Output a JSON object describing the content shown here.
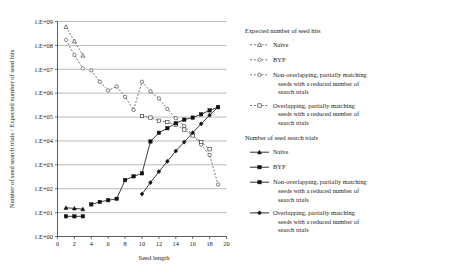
{
  "chart_data": {
    "type": "line",
    "title": "",
    "xlabel": "Seed length",
    "ylabel": "Number of seed search trials / Expected number of seed hits",
    "xlim": [
      0,
      20
    ],
    "ylim": [
      1,
      1000000000
    ],
    "yscale": "log",
    "grid": "horizontal",
    "legend_position": "right",
    "xticks": [
      "0",
      "2",
      "4",
      "6",
      "8",
      "10",
      "12",
      "14",
      "16",
      "18",
      "20"
    ],
    "yticks": [
      "1.E+00",
      "1.E+01",
      "1.E+02",
      "1.E+03",
      "1.E+04",
      "1.E+05",
      "1.E+06",
      "1.E+07",
      "1.E+08",
      "1.E+09"
    ],
    "legend_groups": [
      {
        "heading": "Expected number of seed hits",
        "entries": [
          {
            "label": "Naïve",
            "style": "dashed",
            "marker": "triangle-open"
          },
          {
            "label": "BYP",
            "style": "dashed",
            "marker": "diamond-open"
          },
          {
            "label": "Non-overlapping, partially matching seeds with a reduced number of search trials",
            "style": "dashed",
            "marker": "circle-open"
          },
          {
            "label": "Overlapping, partially matching seeds with a reduced number of search trials",
            "style": "dashed",
            "marker": "square-open"
          }
        ]
      },
      {
        "heading": "Number of seed search trials",
        "entries": [
          {
            "label": "Naïve",
            "style": "solid",
            "marker": "triangle-filled"
          },
          {
            "label": "BYP",
            "style": "solid",
            "marker": "square-filled"
          },
          {
            "label": "Non-overlapping, partially matching seeds with a reduced number of search trials",
            "style": "solid",
            "marker": "square-filled"
          },
          {
            "label": "Overlapping, partially matching seeds with a reduced number of search trials",
            "style": "solid",
            "marker": "diamond-filled"
          }
        ]
      }
    ],
    "series": [
      {
        "name": "Expected number of seed hits — Naïve",
        "group": "Expected number of seed hits",
        "style": "dashed",
        "marker": "triangle-open",
        "x": [
          1,
          2,
          3
        ],
        "values": [
          600000000,
          150000000,
          38000000
        ]
      },
      {
        "name": "Expected number of seed hits — BYP",
        "group": "Expected number of seed hits",
        "style": "dashed",
        "marker": "diamond-open",
        "x": [
          1,
          2,
          3
        ],
        "values": [
          170000000,
          40000000,
          11000000
        ]
      },
      {
        "name": "Expected number of seed hits — Non-overlapping, partially matching seeds with a reduced number of search trials",
        "group": "Expected number of seed hits",
        "style": "dashed",
        "marker": "circle-open",
        "x": [
          4,
          5,
          6,
          7,
          8,
          9,
          10,
          11,
          12,
          13,
          14,
          15,
          16,
          17,
          18,
          19
        ],
        "values": [
          9000000,
          3000000,
          1300000,
          1900000,
          700000,
          200000,
          3000000,
          1200000,
          600000,
          220000,
          90000,
          42000,
          18000,
          7000,
          2600,
          150
        ]
      },
      {
        "name": "Expected number of seed hits — Overlapping, partially matching seeds with a reduced number of search trials",
        "group": "Expected number of seed hits",
        "style": "dashed",
        "marker": "square-open",
        "x": [
          10,
          11,
          12,
          13,
          14,
          15,
          16,
          17,
          18
        ],
        "values": [
          110000,
          95000,
          70000,
          62000,
          48000,
          30000,
          17000,
          9000,
          4500
        ]
      },
      {
        "name": "Number of seed search trials — Naïve",
        "group": "Number of seed search trials",
        "style": "solid",
        "marker": "triangle-filled",
        "x": [
          1,
          2,
          3
        ],
        "values": [
          16,
          15,
          14
        ]
      },
      {
        "name": "Number of seed search trials — BYP",
        "group": "Number of seed search trials",
        "style": "solid",
        "marker": "square-filled",
        "x": [
          1,
          2,
          3
        ],
        "values": [
          7,
          7,
          7
        ]
      },
      {
        "name": "Number of seed search trials — Non-overlapping, partially matching seeds with a reduced number of search trials",
        "group": "Number of seed search trials",
        "style": "solid",
        "marker": "square-filled",
        "x": [
          4,
          5,
          6,
          7,
          8,
          9,
          10,
          11,
          12,
          13,
          14,
          15,
          16,
          17,
          18,
          19
        ],
        "values": [
          22,
          28,
          33,
          38,
          230,
          330,
          440,
          9500,
          22000,
          34000,
          55000,
          78000,
          95000,
          130000,
          190000,
          260000
        ]
      },
      {
        "name": "Number of seed search trials — Overlapping, partially matching seeds with a reduced number of search trials",
        "group": "Number of seed search trials",
        "style": "solid",
        "marker": "diamond-filled",
        "x": [
          10,
          11,
          12,
          13,
          14,
          15,
          16,
          17,
          18,
          19
        ],
        "values": [
          60,
          180,
          520,
          1400,
          3800,
          9000,
          22000,
          52000,
          120000,
          260000
        ]
      }
    ]
  }
}
